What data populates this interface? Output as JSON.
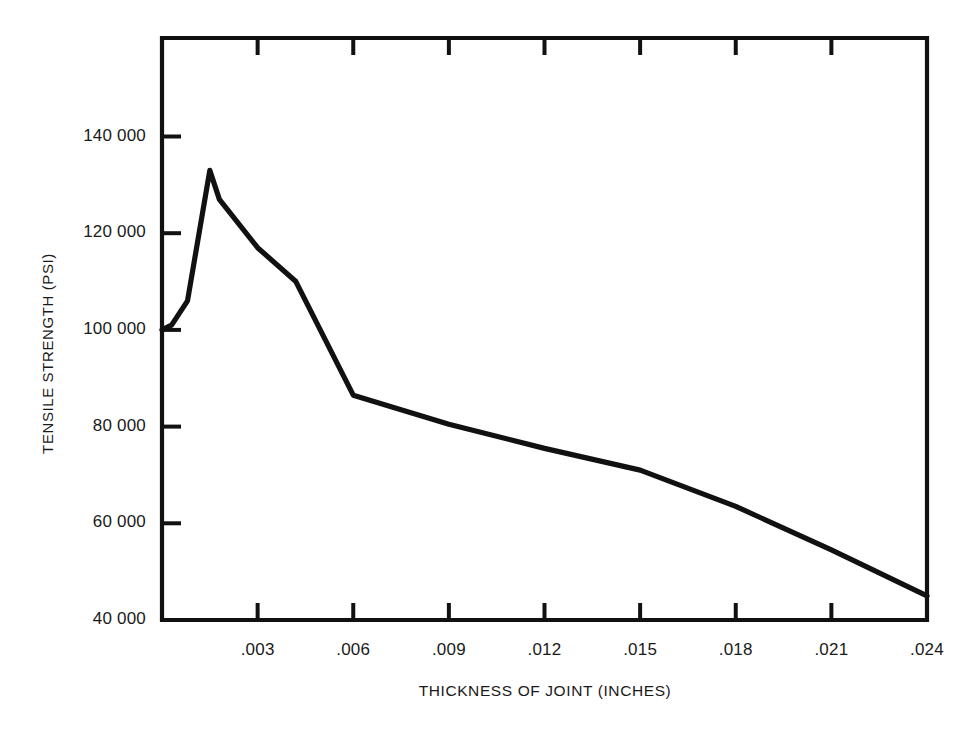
{
  "chart_data": {
    "type": "line",
    "title": "",
    "xlabel": "THICKNESS OF JOINT (INCHES)",
    "ylabel": "TENSILE STRENGTH (PSI)",
    "xlim": [
      0,
      0.024
    ],
    "ylim": [
      40000,
      152000
    ],
    "grid": false,
    "legend": null,
    "xticks": [
      0.003,
      0.006,
      0.009,
      0.012,
      0.015,
      0.018,
      0.021,
      0.024
    ],
    "xtick_labels": [
      ".003",
      ".006",
      ".009",
      ".012",
      ".015",
      ".018",
      ".021",
      ".024"
    ],
    "yticks": [
      40000,
      60000,
      80000,
      100000,
      120000,
      140000
    ],
    "ytick_labels": [
      "40 000",
      "60 000",
      "80 000",
      "100 000",
      "120 000",
      "140 000"
    ],
    "series": [
      {
        "name": "Tensile strength vs joint thickness",
        "color": "#111111",
        "x": [
          0.0,
          0.0003,
          0.0008,
          0.0015,
          0.0018,
          0.003,
          0.0042,
          0.006,
          0.009,
          0.012,
          0.015,
          0.018,
          0.021,
          0.024
        ],
        "y": [
          100000,
          101000,
          106000,
          133000,
          127000,
          117000,
          110000,
          86500,
          80500,
          75500,
          71000,
          63500,
          54500,
          45000
        ]
      }
    ],
    "axis_style": {
      "frame": "left-top-right-bottom",
      "tick_direction": "inward",
      "top_ticks": true,
      "bottom_ticks": true,
      "left_ticks": true,
      "right_ticks": false,
      "line_color": "#111111",
      "background": "#ffffff"
    }
  },
  "ytick_positions_px": [
    620,
    523.5,
    427,
    330.5,
    233,
    136.5
  ],
  "xtick_positions_px": [
    255,
    350,
    446,
    541,
    637,
    732,
    828,
    927
  ]
}
